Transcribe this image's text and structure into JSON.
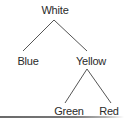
{
  "diagram": {
    "type": "tree",
    "nodes": {
      "root": {
        "label": "White",
        "x": 55,
        "y": 4
      },
      "left": {
        "label": "Blue",
        "x": 28,
        "y": 55
      },
      "right": {
        "label": "Yellow",
        "x": 91,
        "y": 55
      },
      "right_left": {
        "label": "Green",
        "x": 69,
        "y": 105
      },
      "right_right": {
        "label": "Red",
        "x": 109,
        "y": 105
      }
    },
    "edges": [
      {
        "from": "White",
        "to": "Blue"
      },
      {
        "from": "White",
        "to": "Yellow"
      },
      {
        "from": "Yellow",
        "to": "Green"
      },
      {
        "from": "Yellow",
        "to": "Red"
      }
    ],
    "colors": {
      "text": "#2a2a2a",
      "edge": "#555555",
      "rule": "#6a6a6a"
    }
  }
}
